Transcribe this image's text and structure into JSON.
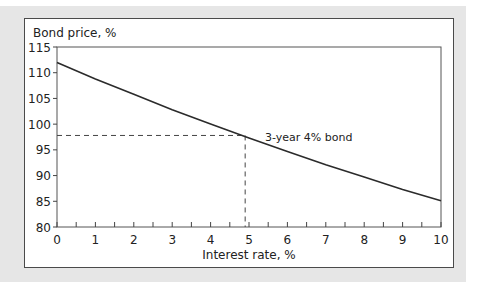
{
  "chart_data": {
    "type": "line",
    "title": "",
    "ylabel": "Bond price, %",
    "xlabel": "Interest rate, %",
    "xlim": [
      0,
      10
    ],
    "ylim": [
      80,
      115
    ],
    "xticks": [
      0,
      1,
      2,
      3,
      4,
      5,
      6,
      7,
      8,
      9,
      10
    ],
    "yticks": [
      80,
      85,
      90,
      95,
      100,
      105,
      110,
      115
    ],
    "grid": false,
    "legend": null,
    "series": [
      {
        "name": "3-year 4% bond",
        "x": [
          0,
          1,
          2,
          3,
          4,
          5,
          6,
          7,
          8,
          9,
          10
        ],
        "values": [
          112.0,
          108.8,
          105.8,
          102.8,
          100.0,
          97.3,
          94.7,
          92.1,
          89.7,
          87.3,
          85.1
        ]
      }
    ],
    "annotations": [
      {
        "type": "text",
        "text": "3-year 4% bond",
        "x": 5.5,
        "y": 97.3
      },
      {
        "type": "dashed-guide",
        "x": 4.9,
        "y": 97.8,
        "description": "dashed horizontal from y-axis and dashed vertical from x-axis meeting on the curve"
      }
    ]
  },
  "labels": {
    "y_axis_title": "Bond price, %",
    "x_axis_title": "Interest rate, %",
    "curve_label": "3-year 4% bond"
  }
}
